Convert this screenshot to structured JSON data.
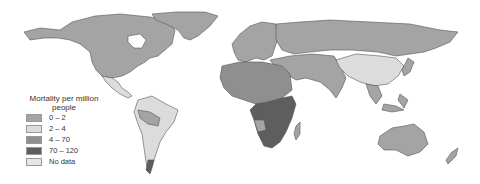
{
  "legend": {
    "title_line1": "Mortality per million",
    "title_line2": "people",
    "items": [
      {
        "label": "0 – 2",
        "color": "#a4a4a4"
      },
      {
        "label": "2 – 4",
        "color": "#dcdcdc"
      },
      {
        "label": "4 – 70",
        "color": "#8f8f8f"
      },
      {
        "label": "70 – 120",
        "color": "#5e5e5e"
      },
      {
        "label": "No data",
        "color": "#e6e6e6"
      }
    ]
  },
  "colors": {
    "background": "#ffffff",
    "border": "#555555"
  },
  "regions": [
    {
      "name": "North America",
      "class": "0 – 2"
    },
    {
      "name": "Greenland",
      "class": "0 – 2"
    },
    {
      "name": "Mexico",
      "class": "2 – 4"
    },
    {
      "name": "South America",
      "class": "2 – 4"
    },
    {
      "name": "Europe",
      "class": "0 – 2"
    },
    {
      "name": "Russia",
      "class": "0 – 2"
    },
    {
      "name": "China",
      "class": "2 – 4"
    },
    {
      "name": "North Africa",
      "class": "4 – 70"
    },
    {
      "name": "Sub-Saharan Africa",
      "class": "70 – 120"
    },
    {
      "name": "Australia",
      "class": "0 – 2"
    }
  ]
}
